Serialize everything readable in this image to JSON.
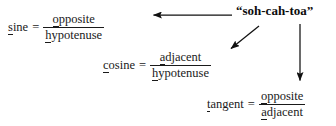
{
  "figure": {
    "background_color": "#ffffff",
    "text_color": "#1a1a1a"
  },
  "mnemonic": {
    "label": "“soh-cah-toa”"
  },
  "equations": {
    "sine": {
      "name_underlined": "s",
      "name_rest": "ine",
      "equals": "=",
      "numerator_underlined": "o",
      "numerator_rest": "pposite",
      "denominator_underlined": "h",
      "denominator_rest": "ypotenuse"
    },
    "cosine": {
      "name_underlined": "c",
      "name_rest": "osine",
      "equals": "=",
      "numerator_underlined": "a",
      "numerator_rest": "djacent",
      "denominator_underlined": "h",
      "denominator_rest": "ypotenuse"
    },
    "tangent": {
      "name_underlined": "t",
      "name_rest": "angent",
      "equals": "=",
      "numerator_underlined": "o",
      "numerator_rest": "pposite",
      "denominator_underlined": "a",
      "denominator_rest": "djacent"
    }
  },
  "arrows": [
    {
      "name": "arrow-to-sine",
      "direction": "left",
      "from_x": 232,
      "from_y": 15,
      "to_x": 152,
      "to_y": 15,
      "color": "#111111"
    },
    {
      "name": "arrow-to-cosine",
      "direction": "down-left-diagonal",
      "from_x": 259,
      "from_y": 26,
      "to_x": 229,
      "to_y": 50,
      "color": "#111111"
    },
    {
      "name": "arrow-to-tangent",
      "direction": "down",
      "from_x": 300,
      "from_y": 24,
      "to_x": 300,
      "to_y": 82,
      "color": "#111111"
    }
  ]
}
